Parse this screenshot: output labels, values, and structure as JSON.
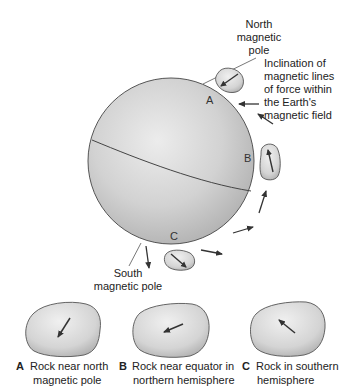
{
  "figure": {
    "type": "diagram"
  },
  "globe": {
    "north_pole_label": [
      "North",
      "magnetic",
      "pole"
    ],
    "south_pole_label": [
      "South",
      "magnetic pole"
    ],
    "site_labels": {
      "a": "A",
      "b": "B",
      "c": "C"
    }
  },
  "annotation": {
    "lines": [
      "Inclination of",
      "magnetic lines",
      "of force within",
      "the Earth's",
      "magnetic field"
    ]
  },
  "field_arrows": [
    {
      "position": "near A",
      "direction": "left"
    },
    {
      "position": "between A and B",
      "direction": "up-left"
    },
    {
      "position": "below B",
      "direction": "up"
    },
    {
      "position": "lower right",
      "direction": "right-up"
    },
    {
      "position": "near C right",
      "direction": "right-down"
    },
    {
      "position": "south pole",
      "direction": "down"
    }
  ],
  "rocks": [
    {
      "letter": "A",
      "caption": [
        "Rock near north",
        "magnetic pole"
      ],
      "arrow": "down-left (steep)"
    },
    {
      "letter": "B",
      "caption": [
        "Rock near equator in",
        "northern hemisphere"
      ],
      "arrow": "left (shallow down)"
    },
    {
      "letter": "C",
      "caption": [
        "Rock in southern",
        "hemisphere"
      ],
      "arrow": "up-left"
    }
  ],
  "colors": {
    "globe_light": "#e6e6e6",
    "globe_dark": "#b4b4b4",
    "rock_light": "#ececec",
    "rock_dark": "#b8b8b8",
    "outline": "#555555",
    "arrow": "#333333"
  }
}
